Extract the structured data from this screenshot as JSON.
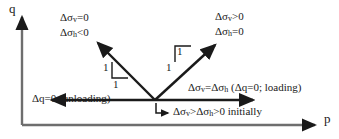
{
  "figure": {
    "type": "stress-path-diagram",
    "background_color": "#ffffff",
    "line_color": "#1a1a1a",
    "text_color": "#1a1a1a",
    "axes": {
      "y_label": "q",
      "x_label": "p",
      "origin_px": [
        22,
        125
      ],
      "y_axis_top_px": [
        22,
        14
      ],
      "x_axis_right_px": [
        318,
        125
      ]
    },
    "vertex_px": [
      155,
      100
    ],
    "annotations": {
      "left_branch_line1": "Δσ",
      "left_branch_line1_sub": "v",
      "left_branch_line1_rest": "=0",
      "left_branch_line2": "Δσ",
      "left_branch_line2_sub": "h",
      "left_branch_line2_rest": "<0",
      "right_branch_line1": "Δσ",
      "right_branch_line1_sub": "v",
      "right_branch_line1_rest": ">0",
      "right_branch_line2": "Δσ",
      "right_branch_line2_sub": "h",
      "right_branch_line2_rest": "=0",
      "loading_prefix": "Δσ",
      "loading_sub1": "v",
      "loading_mid": "=Δσ",
      "loading_sub2": "h",
      "loading_suffix": " (Δq=0; loading)",
      "unloading": "Δq=0 (unloading)",
      "initial_prefix": "Δσ",
      "initial_sub1": "v",
      "initial_mid": ">Δσ",
      "initial_sub2": "h",
      "initial_suffix": ">0 initially"
    },
    "slope_markers": {
      "left_vertical": "1",
      "left_horizontal": "1",
      "right_vertical": "1",
      "right_horizontal": "1"
    }
  }
}
